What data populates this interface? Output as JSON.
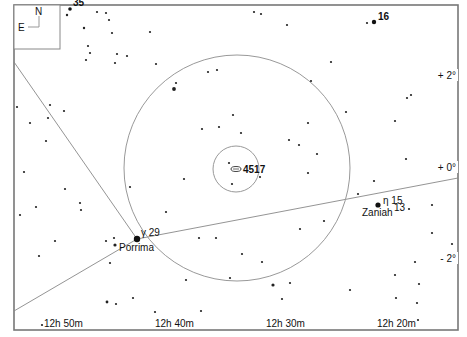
{
  "chart_data": {
    "type": "scatter",
    "frame": {
      "left": 14,
      "top": 5,
      "right": 458,
      "bottom": 330
    },
    "compass": {
      "north": "N",
      "east": "E"
    },
    "x_axis": {
      "label": "Right Ascension",
      "ticks": [
        {
          "label": "12h 50m",
          "x": 44
        },
        {
          "label": "12h 40m",
          "x": 155
        },
        {
          "label": "12h 30m",
          "x": 266
        },
        {
          "label": "12h 20m",
          "x": 377
        }
      ]
    },
    "y_axis": {
      "label": "Declination",
      "ticks": [
        {
          "label": "+ 2°",
          "y": 78
        },
        {
          "label": "+ 0°",
          "y": 170
        },
        {
          "label": "- 2°",
          "y": 261
        }
      ]
    },
    "target": {
      "name": "4517",
      "x": 236,
      "y": 169
    },
    "field_circles": [
      {
        "name": "large-field",
        "cx": 237,
        "cy": 168,
        "r": 113
      },
      {
        "name": "small-field",
        "cx": 236,
        "cy": 169,
        "r": 23
      }
    ],
    "lines": [
      {
        "name": "constellation-line-1",
        "points": [
          [
            14,
            62
          ],
          [
            137,
            239
          ]
        ]
      },
      {
        "name": "constellation-line-2",
        "points": [
          [
            137,
            239
          ],
          [
            14,
            311
          ]
        ]
      },
      {
        "name": "ecliptic-or-boundary",
        "points": [
          [
            137,
            239
          ],
          [
            458,
            178
          ]
        ]
      }
    ],
    "named_stars": [
      {
        "label": "Porrima",
        "greek": "γ",
        "flamsteed": "29",
        "x": 137,
        "y": 239,
        "size": 3.2
      },
      {
        "label": "Zaniah",
        "greek": "η",
        "flamsteed": "15",
        "extra": "13",
        "x": 378,
        "y": 205,
        "size": 2.6
      },
      {
        "label": "",
        "flamsteed": "16",
        "x": 374,
        "y": 22,
        "size": 2.2
      },
      {
        "label": "",
        "flamsteed": "35",
        "x": 70,
        "y": 9,
        "size": 1.8
      }
    ],
    "stars": [
      [
        67,
        15,
        1.2
      ],
      [
        97,
        12,
        1.1
      ],
      [
        106,
        13,
        1.1
      ],
      [
        109,
        20,
        1.1
      ],
      [
        84,
        28,
        1.2
      ],
      [
        112,
        33,
        1.1
      ],
      [
        150,
        32,
        1.1
      ],
      [
        127,
        56,
        1.1
      ],
      [
        117,
        54,
        1.1
      ],
      [
        115,
        63,
        1.1
      ],
      [
        88,
        46,
        1.1
      ],
      [
        90,
        53,
        1.1
      ],
      [
        86,
        60,
        1.1
      ],
      [
        156,
        64,
        1.1
      ],
      [
        176,
        83,
        1.1
      ],
      [
        174,
        89,
        1.9
      ],
      [
        217,
        70,
        1.1
      ],
      [
        208,
        72,
        1.1
      ],
      [
        254,
        12,
        1.1
      ],
      [
        261,
        14,
        1.1
      ],
      [
        287,
        25,
        1.1
      ],
      [
        367,
        23,
        1.1
      ],
      [
        331,
        62,
        1.1
      ],
      [
        311,
        81,
        1.1
      ],
      [
        308,
        123,
        1.1
      ],
      [
        346,
        112,
        1.1
      ],
      [
        407,
        98,
        1.1
      ],
      [
        411,
        95,
        1.1
      ],
      [
        395,
        121,
        1.1
      ],
      [
        445,
        71,
        1.4
      ],
      [
        406,
        159,
        1.1
      ],
      [
        299,
        145,
        1.1
      ],
      [
        289,
        140,
        1.1
      ],
      [
        317,
        154,
        1.1
      ],
      [
        308,
        173,
        1.1
      ],
      [
        219,
        127,
        1.1
      ],
      [
        241,
        133,
        1.1
      ],
      [
        260,
        177,
        1.1
      ],
      [
        184,
        179,
        1.1
      ],
      [
        233,
        115,
        1.1
      ],
      [
        202,
        129,
        1.1
      ],
      [
        229,
        163,
        1.1
      ],
      [
        232,
        184,
        1.1
      ],
      [
        50,
        105,
        1.1
      ],
      [
        30,
        123,
        1.1
      ],
      [
        48,
        118,
        1.1
      ],
      [
        46,
        141,
        1.1
      ],
      [
        64,
        111,
        1.1
      ],
      [
        17,
        107,
        1.1
      ],
      [
        24,
        172,
        1.1
      ],
      [
        65,
        189,
        1.1
      ],
      [
        80,
        203,
        1.1
      ],
      [
        81,
        210,
        1.1
      ],
      [
        36,
        207,
        1.1
      ],
      [
        20,
        215,
        1.1
      ],
      [
        55,
        241,
        1.1
      ],
      [
        39,
        256,
        1.1
      ],
      [
        106,
        241,
        1.1
      ],
      [
        114,
        238,
        1.1
      ],
      [
        110,
        263,
        1.1
      ],
      [
        130,
        187,
        1.1
      ],
      [
        115,
        245,
        1.6
      ],
      [
        166,
        212,
        1.1
      ],
      [
        199,
        238,
        1.1
      ],
      [
        216,
        238,
        1.1
      ],
      [
        242,
        254,
        1.1
      ],
      [
        262,
        262,
        1.1
      ],
      [
        273,
        285,
        1.6
      ],
      [
        290,
        283,
        1.1
      ],
      [
        282,
        299,
        1.1
      ],
      [
        186,
        280,
        1.1
      ],
      [
        230,
        278,
        1.1
      ],
      [
        300,
        229,
        1.1
      ],
      [
        324,
        221,
        1.1
      ],
      [
        358,
        194,
        1.1
      ],
      [
        374,
        181,
        1.1
      ],
      [
        409,
        209,
        1.1
      ],
      [
        432,
        205,
        1.1
      ],
      [
        432,
        233,
        1.1
      ],
      [
        452,
        244,
        1.1
      ],
      [
        415,
        262,
        1.1
      ],
      [
        395,
        275,
        1.1
      ],
      [
        419,
        284,
        1.1
      ],
      [
        396,
        298,
        1.1
      ],
      [
        417,
        303,
        1.1
      ],
      [
        418,
        320,
        1.1
      ],
      [
        107,
        302,
        1.4
      ],
      [
        116,
        304,
        1.1
      ],
      [
        133,
        298,
        1.1
      ],
      [
        155,
        312,
        1.1
      ],
      [
        201,
        311,
        1.1
      ],
      [
        350,
        290,
        1.1
      ],
      [
        42,
        325,
        1.1
      ]
    ]
  }
}
